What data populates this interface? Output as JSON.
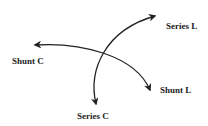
{
  "diagram": {
    "type": "smith-chart-element-directions",
    "labels": {
      "series_l": "Series L",
      "shunt_c": "Shunt C",
      "shunt_l": "Shunt L",
      "series_c": "Series C"
    },
    "colors": {
      "stroke": "#222222",
      "background": "#ffffff"
    }
  }
}
